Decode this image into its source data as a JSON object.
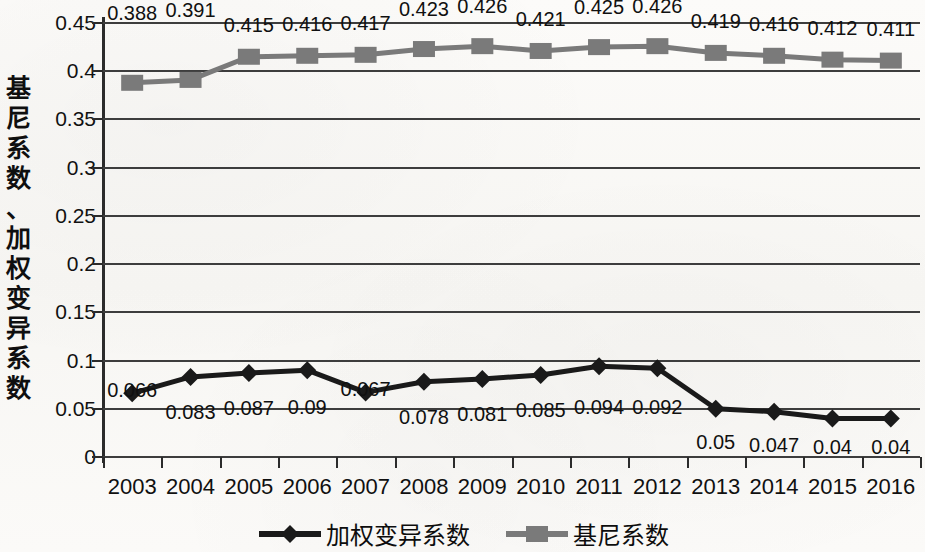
{
  "chart_data": {
    "type": "line",
    "title": "",
    "xlabel": "",
    "ylabel": "基尼系数、加权变异系数",
    "ylim": [
      0,
      0.45
    ],
    "ytick_labels": [
      "0.45",
      "0.4",
      "0.35",
      "0.3",
      "0.25",
      "0.2",
      "0.15",
      "0.1",
      "0.05",
      "0"
    ],
    "ytick_values": [
      0.45,
      0.4,
      0.35,
      0.3,
      0.25,
      0.2,
      0.15,
      0.1,
      0.05,
      0
    ],
    "grid": true,
    "legend_position": "bottom",
    "categories": [
      "2003",
      "2004",
      "2005",
      "2006",
      "2007",
      "2008",
      "2009",
      "2010",
      "2011",
      "2012",
      "2013",
      "2014",
      "2015",
      "2016"
    ],
    "series": [
      {
        "name": "加权变异系数",
        "marker": "diamond",
        "color": "#1a1a1a",
        "values": [
          0.066,
          0.083,
          0.087,
          0.09,
          0.067,
          0.078,
          0.081,
          0.085,
          0.094,
          0.092,
          0.05,
          0.047,
          0.04,
          0.04
        ],
        "labels": [
          "0.066",
          "0.083",
          "0.087",
          "0.09",
          "0.067",
          "0.078",
          "0.081",
          "0.085",
          "0.094",
          "0.092",
          "0.05",
          "0.047",
          "0.04",
          "0.04"
        ],
        "label_offsets": [
          0,
          38,
          38,
          40,
          0,
          38,
          38,
          38,
          44,
          42,
          36,
          36,
          32,
          32
        ]
      },
      {
        "name": "基尼系数",
        "marker": "square",
        "color": "#7a7a7a",
        "values": [
          0.388,
          0.391,
          0.415,
          0.416,
          0.417,
          0.423,
          0.426,
          0.421,
          0.425,
          0.426,
          0.419,
          0.416,
          0.412,
          0.411
        ],
        "labels": [
          "0.388",
          "0.391",
          "0.415",
          "0.416",
          "0.417",
          "0.423",
          "0.426",
          "0.421",
          "0.425",
          "0.426",
          "0.419",
          "0.416",
          "0.412",
          "0.411"
        ],
        "label_offsets": [
          -67,
          -67,
          -29,
          -29,
          -29,
          -37,
          -37,
          -29,
          -37,
          -37,
          -29,
          -29,
          -29,
          -29
        ]
      }
    ]
  },
  "legend": {
    "items": [
      {
        "label": "加权变异系数",
        "marker": "diamond",
        "color": "#1a1a1a"
      },
      {
        "label": "基尼系数",
        "marker": "square",
        "color": "#7a7a7a"
      }
    ]
  }
}
